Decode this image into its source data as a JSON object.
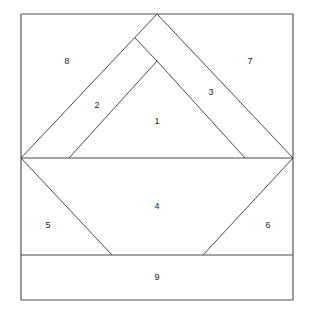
{
  "figure": {
    "canvas": {
      "width": 314,
      "height": 319
    },
    "colors": {
      "background": "#ffffff",
      "line": "#4a4a4a",
      "border": "#555555",
      "label_text": "#1a1a1a"
    },
    "bounds": {
      "left": 21,
      "top": 14,
      "right": 293,
      "bottom": 300
    },
    "key_points": {
      "top_apex": [
        157,
        14
      ],
      "left_vertex": [
        21,
        158
      ],
      "right_vertex": [
        293,
        158
      ],
      "inner_apex": [
        157,
        61
      ],
      "inner_base_left": [
        69,
        158
      ],
      "inner_base_right": [
        245,
        158
      ],
      "band_top_junction": [
        135,
        38
      ],
      "lower_left_foot": [
        112,
        255
      ],
      "lower_right_foot": [
        203,
        255
      ],
      "strip_line_y": 255
    },
    "labels": [
      {
        "id": "region-1",
        "text": "1",
        "x": 157,
        "y": 122,
        "shape": "inner triangle / central kite"
      },
      {
        "id": "region-2",
        "text": "2",
        "x": 97,
        "y": 106,
        "shape": "left parallel band"
      },
      {
        "id": "region-3",
        "text": "3",
        "x": 211,
        "y": 93,
        "shape": "right parallel band"
      },
      {
        "id": "region-4",
        "text": "4",
        "x": 157,
        "y": 207,
        "shape": "lower trapezoid"
      },
      {
        "id": "region-5",
        "text": "5",
        "x": 48,
        "y": 226,
        "shape": "lower left triangle"
      },
      {
        "id": "region-6",
        "text": "6",
        "x": 268,
        "y": 226,
        "shape": "lower right triangle"
      },
      {
        "id": "region-7",
        "text": "7",
        "x": 250,
        "y": 62,
        "shape": "upper right triangle"
      },
      {
        "id": "region-8",
        "text": "8",
        "x": 67,
        "y": 62,
        "shape": "upper left triangle"
      },
      {
        "id": "region-9",
        "text": "9",
        "x": 157,
        "y": 278,
        "shape": "bottom strip"
      }
    ],
    "segments": [
      {
        "name": "outer-rectangle",
        "points": "21,14 293,14 293,300 21,300 21,14"
      },
      {
        "name": "horizontal-midline",
        "points": "21,158 293,158"
      },
      {
        "name": "strip-divider",
        "points": "21,255 293,255"
      },
      {
        "name": "upper-left-diagonal",
        "points": "21,158 157,14"
      },
      {
        "name": "upper-right-diagonal",
        "points": "157,14 293,158"
      },
      {
        "name": "inner-left-diagonal",
        "points": "69,158 157,61"
      },
      {
        "name": "inner-right-diagonal",
        "points": "157,61 245,158"
      },
      {
        "name": "band-connector-left",
        "points": "135,38 157,61"
      },
      {
        "name": "lower-left-diagonal",
        "points": "21,158 112,255"
      },
      {
        "name": "lower-right-diagonal",
        "points": "293,158 203,255"
      }
    ]
  }
}
